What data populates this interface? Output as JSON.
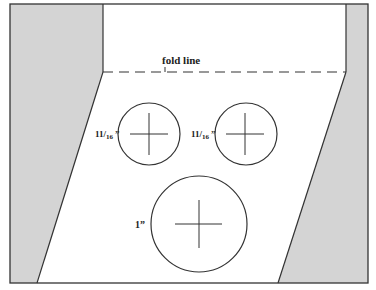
{
  "diagram": {
    "colors": {
      "background": "#ffffff",
      "gray_region": "#d4d4d4",
      "stroke": "#333333"
    },
    "fold_label": "fold line",
    "circles": [
      {
        "id": "small-left",
        "label_main": "11",
        "label_sub": "16",
        "label_suffix": "”",
        "cx": 149,
        "cy": 134,
        "r": 31
      },
      {
        "id": "small-right",
        "label_main": "11",
        "label_sub": "16",
        "label_suffix": "”",
        "cx": 246,
        "cy": 134,
        "r": 31
      },
      {
        "id": "large",
        "label": "1”",
        "cx": 199,
        "cy": 224,
        "r": 48
      }
    ]
  }
}
